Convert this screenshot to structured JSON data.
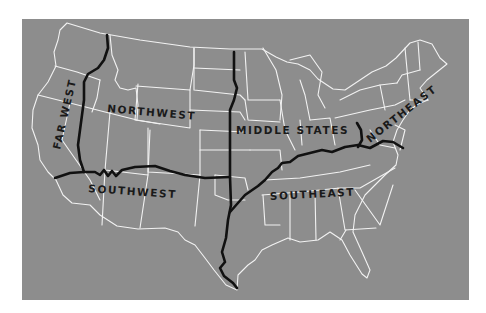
{
  "map": {
    "title": "",
    "background_color": "#ffffff",
    "land_color": "#8d8d8d",
    "state_border_color": "#f2f2f2",
    "region_divider_color": "#111111",
    "regions": [
      {
        "id": "far-west",
        "label": "FAR WEST"
      },
      {
        "id": "northwest",
        "label": "NORTHWEST"
      },
      {
        "id": "middle-states",
        "label": "MIDDLE STATES"
      },
      {
        "id": "northeast",
        "label": "NORTHEAST"
      },
      {
        "id": "southwest",
        "label": "SOUTHWEST"
      },
      {
        "id": "southeast",
        "label": "SOUTHEAST"
      }
    ]
  }
}
